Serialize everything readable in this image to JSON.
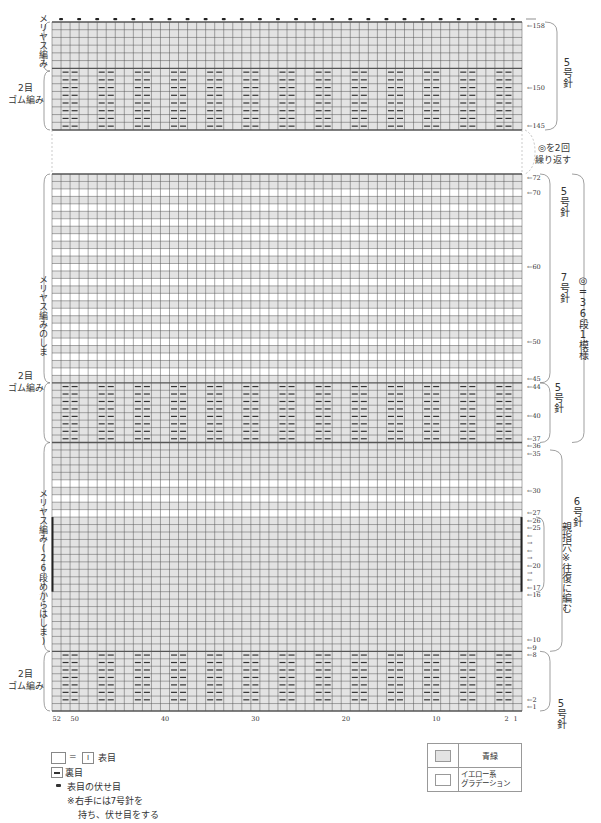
{
  "chart_data": {
    "type": "knitting-chart",
    "stitch_columns": 52,
    "column_ticks": [
      "52",
      "50",
      "40",
      "30",
      "20",
      "10",
      "2",
      "1"
    ],
    "sections": [
      {
        "name": "top-stockinette",
        "rows": [
          153,
          158
        ],
        "stitch": "メリヤス編み",
        "color": "青緑",
        "bind_off": true
      },
      {
        "name": "top-rib",
        "rows": [
          145,
          152
        ],
        "stitch": "2目ゴム編み",
        "color": "青緑"
      },
      {
        "name": "stripe-stockinette",
        "rows": [
          45,
          72
        ],
        "stitch": "メリヤス編みのしま",
        "color": "stripes"
      },
      {
        "name": "middle-rib",
        "rows": [
          37,
          44
        ],
        "stitch": "2目ゴム編み",
        "color": "青緑"
      },
      {
        "name": "body-stockinette",
        "rows": [
          9,
          36
        ],
        "stitch": "メリヤス編み(26段めからはしま)",
        "color": "青緑 with yellow stripes"
      },
      {
        "name": "bottom-rib",
        "rows": [
          1,
          8
        ],
        "stitch": "2目ゴム編み",
        "color": "青緑"
      }
    ],
    "row_markers": [
      "158",
      "150",
      "145",
      "72",
      "70",
      "60",
      "50",
      "45",
      "44",
      "40",
      "37",
      "36",
      "35",
      "30",
      "27",
      "26",
      "25",
      "20",
      "17",
      "16",
      "10",
      "9",
      "8",
      "2",
      "1"
    ],
    "needle_annotations": [
      {
        "rows": "145-158",
        "needle": "5号針"
      },
      {
        "rows": "72-45",
        "needle": "5号針 / 7号針"
      },
      {
        "rows": "44-37",
        "needle": "5号針"
      },
      {
        "rows": "35-9",
        "needle": "6号針"
      },
      {
        "rows": "8-1",
        "needle": "5号針"
      }
    ],
    "repeat_note": "◎を2回繰り返す",
    "pattern_repeat": "◎ = 36段1模様",
    "thumb_hole": "親指穴 ※往復に編む (rows 17-26)"
  },
  "left_labels": {
    "top_stockinette": "メリヤス編み",
    "top_rib_1": "2目",
    "top_rib_2": "ゴム編み",
    "stripe": "メリヤス編みのしま",
    "mid_rib_1": "2目",
    "mid_rib_2": "ゴム編み",
    "body": "メリヤス編み(26段めからはしま)",
    "bot_rib_1": "2目",
    "bot_rib_2": "ゴム編み"
  },
  "right_labels": {
    "needle5_top": "5号針",
    "repeat": "◎を2回",
    "repeat2": "繰り返す",
    "needle5_a": "5号針",
    "needle7": "7号針",
    "pattern": "◎=36段1模様",
    "needle5_mid": "5号針",
    "needle6": "6号針",
    "thumb": "親指穴※往復に編む",
    "needle5_bot": "5号針"
  },
  "legend": {
    "knit_eq": "=",
    "knit_symbol": "I",
    "knit_label": "表目",
    "purl_label": "裏目",
    "bindoff_label": "表目の伏せ目",
    "note1": "※右手には7号針を",
    "note2": "持ち、伏せ目をする"
  },
  "color_legend": {
    "teal_label": "青緑",
    "yellow_label_1": "イエロー系",
    "yellow_label_2": "グラデーション",
    "teal_hex": "#e3e3e3",
    "yellow_hex": "#ffffff"
  }
}
